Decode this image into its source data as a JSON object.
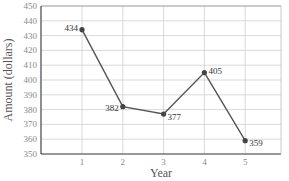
{
  "chart_data": {
    "type": "line",
    "title": "",
    "xlabel": "Year",
    "ylabel": "Amount (dollars)",
    "categories": [
      "1",
      "2",
      "3",
      "4",
      "5"
    ],
    "x": [
      1,
      2,
      3,
      4,
      5
    ],
    "values": [
      434,
      382,
      377,
      405,
      359
    ],
    "data_labels": [
      "434",
      "382",
      "377",
      "405",
      "359"
    ],
    "ylim": [
      350,
      450
    ],
    "xlim": [
      0,
      5.85
    ],
    "yticks": [
      350,
      360,
      370,
      380,
      390,
      400,
      410,
      420,
      430,
      440,
      450
    ],
    "xticks": [
      1,
      2,
      3,
      4,
      5
    ],
    "grid": true,
    "legend": null,
    "colors": {
      "line": "#555555",
      "marker": "#444444",
      "grid": "#cfcfcf",
      "axis": "#444444"
    }
  }
}
